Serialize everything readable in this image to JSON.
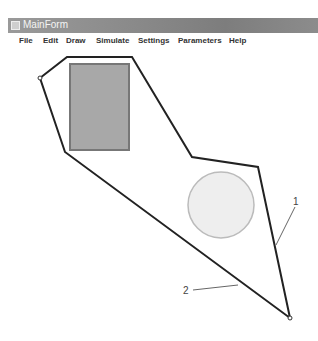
{
  "window": {
    "title": "MainForm"
  },
  "menu": {
    "items": [
      {
        "label": "File"
      },
      {
        "label": "Edit"
      },
      {
        "label": "Draw"
      },
      {
        "label": "Simulate"
      },
      {
        "label": "Settings"
      },
      {
        "label": "Parameters"
      },
      {
        "label": "Help"
      }
    ]
  },
  "canvas": {
    "polygon_points": "40,78 67,57 132,57 192,157 258,167 290,318 65,152",
    "rectangle": {
      "x": 70,
      "y": 64,
      "width": 59,
      "height": 86,
      "fill": "#a8a8a8",
      "stroke": "#777777"
    },
    "circle": {
      "cx": 221,
      "cy": 205,
      "r": 33,
      "fill": "#eeeeee",
      "stroke": "#bbbbbb"
    },
    "annotations": [
      {
        "label": "1"
      },
      {
        "label": "2"
      }
    ]
  }
}
